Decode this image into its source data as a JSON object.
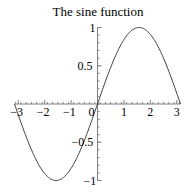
{
  "chart_data": {
    "type": "line",
    "title": "The sine function",
    "xlabel": "",
    "ylabel": "",
    "function": "sin(x)",
    "xlim": [
      -3.14159,
      3.14159
    ],
    "ylim": [
      -1,
      1
    ],
    "x_ticks": [
      -3,
      -2,
      -1,
      0,
      1,
      2,
      3
    ],
    "y_ticks": [
      -1,
      -0.5,
      0.5,
      1
    ],
    "x_tick_labels": [
      "-3",
      "-2",
      "-1",
      "0",
      "1",
      "2",
      "3"
    ],
    "y_tick_labels": [
      "-1",
      "-0.5",
      "0.5",
      "1"
    ],
    "grid": false,
    "legend": false,
    "series": [
      {
        "name": "sin(x)",
        "x": [
          -3.14,
          -2.5,
          -2.0,
          -1.5708,
          -1.0,
          -0.5,
          0,
          0.5,
          1.0,
          1.5708,
          2.0,
          2.5,
          3.14
        ],
        "y": [
          0,
          -0.598,
          -0.909,
          -1,
          -0.841,
          -0.479,
          0,
          0.479,
          0.841,
          1,
          0.909,
          0.598,
          0
        ]
      }
    ],
    "color": "#404040"
  }
}
